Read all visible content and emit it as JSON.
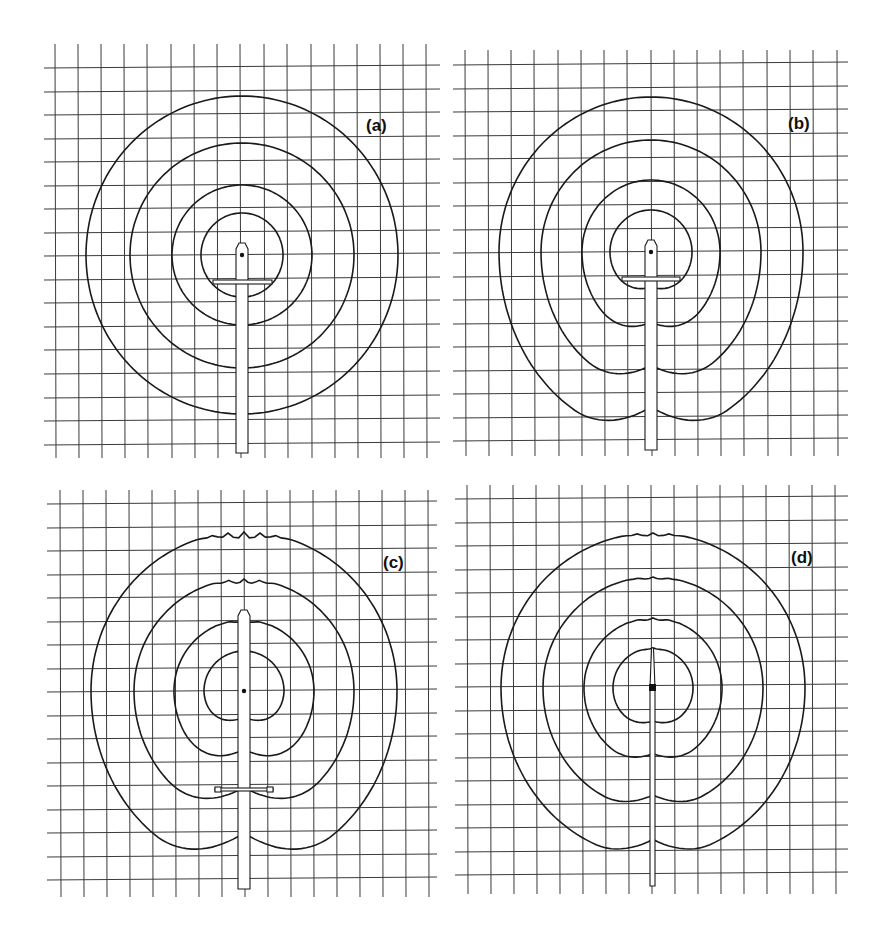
{
  "figure": {
    "title": "",
    "colors": {
      "ink": "#1a1a1a",
      "grid": "#3a3a3a",
      "background": "#ffffff"
    },
    "panels": [
      {
        "id": "a",
        "label": "(a)",
        "label_pos": [
          366,
          131
        ],
        "grid": {
          "x0": 55,
          "x1": 427,
          "y0": 44,
          "y1": 458,
          "cols_x": [
            55,
            78,
            101,
            124,
            147,
            171,
            194,
            217,
            240,
            264,
            287,
            311,
            334,
            357,
            380,
            403,
            426
          ],
          "rows_y": [
            67,
            91,
            114,
            138,
            161,
            185,
            208,
            232,
            255,
            279,
            302,
            326,
            349,
            373,
            397,
            420,
            444
          ],
          "line_left": 44,
          "line_right": 440
        },
        "center": [
          242,
          255
        ],
        "contours": [
          {
            "rx": 41,
            "ry": 42,
            "dy": 0,
            "lobe": 0
          },
          {
            "rx": 70,
            "ry": 70,
            "dy": 0,
            "lobe": 0
          },
          {
            "rx": 112,
            "ry": 112,
            "dy": 1,
            "lobe": 0
          },
          {
            "rx": 156,
            "ry": 159,
            "dy": 0,
            "lobe": 0
          }
        ],
        "rod": {
          "x": 236,
          "w": 12,
          "top": 243,
          "bottom": 453,
          "needle": false
        },
        "crossbar": {
          "x1": 213,
          "x2": 272,
          "y": 280,
          "h": 4,
          "end_squares": false
        }
      },
      {
        "id": "b",
        "label": "(b)",
        "label_pos": [
          788,
          129
        ],
        "grid": {
          "x0": 464,
          "x1": 846,
          "y0": 50,
          "y1": 456,
          "cols_x": [
            465,
            488,
            511,
            534,
            558,
            581,
            604,
            627,
            651,
            674,
            697,
            720,
            743,
            767,
            790,
            813,
            837
          ],
          "rows_y": [
            64,
            88,
            111,
            135,
            158,
            182,
            205,
            229,
            252,
            276,
            299,
            323,
            346,
            370,
            393,
            417,
            440
          ],
          "line_left": 453,
          "line_right": 848
        },
        "center": [
          651,
          252
        ],
        "contours": [
          {
            "rx": 41,
            "ry": 42,
            "dy": 0,
            "lobe": 1
          },
          {
            "rx": 69,
            "ry": 72,
            "dy": 12,
            "lobe": 2
          },
          {
            "rx": 110,
            "ry": 112,
            "dy": 22,
            "lobe": 3
          },
          {
            "rx": 152,
            "ry": 155,
            "dy": 28,
            "lobe": 4
          }
        ],
        "rod": {
          "x": 645,
          "w": 12,
          "top": 240,
          "bottom": 450,
          "needle": false
        },
        "crossbar": {
          "x1": 622,
          "x2": 680,
          "y": 277,
          "h": 4,
          "end_squares": false
        }
      },
      {
        "id": "c",
        "label": "(c)",
        "label_pos": [
          383,
          568
        ],
        "grid": {
          "x0": 60,
          "x1": 430,
          "y0": 490,
          "y1": 897,
          "cols_x": [
            60,
            83,
            106,
            129,
            152,
            175,
            198,
            221,
            244,
            267,
            290,
            313,
            336,
            359,
            382,
            405,
            428
          ],
          "rows_y": [
            503,
            527,
            550,
            574,
            597,
            621,
            644,
            668,
            691,
            715,
            738,
            762,
            785,
            809,
            832,
            856,
            879
          ],
          "line_left": 47,
          "line_right": 437
        },
        "center": [
          244,
          691
        ],
        "contours": [
          {
            "rx": 40,
            "ry": 40,
            "dy": 0,
            "lobe": 2,
            "top_notch": 0
          },
          {
            "rx": 70,
            "ry": 71,
            "dy": 8,
            "lobe": 3,
            "top_notch": 1
          },
          {
            "rx": 110,
            "ry": 112,
            "dy": 12,
            "lobe": 4,
            "top_notch": 2
          },
          {
            "rx": 153,
            "ry": 159,
            "dy": 18,
            "lobe": 5,
            "top_notch": 3
          }
        ],
        "rod": {
          "x": 238,
          "w": 12,
          "top": 610,
          "bottom": 889,
          "needle": false
        },
        "crossbar": {
          "x1": 215,
          "x2": 273,
          "y": 788,
          "h": 3,
          "end_squares": true
        }
      },
      {
        "id": "d",
        "label": "(d)",
        "label_pos": [
          791,
          563
        ],
        "grid": {
          "x0": 467,
          "x1": 836,
          "y0": 485,
          "y1": 894,
          "cols_x": [
            467,
            490,
            513,
            536,
            559,
            582,
            605,
            628,
            651,
            674,
            697,
            720,
            743,
            766,
            789,
            812,
            835
          ],
          "rows_y": [
            498,
            522,
            545,
            569,
            592,
            616,
            639,
            663,
            686,
            710,
            733,
            757,
            780,
            804,
            827,
            851,
            874
          ],
          "line_left": 455,
          "line_right": 848
        },
        "center": [
          653,
          688
        ],
        "contours": [
          {
            "rx": 40,
            "ry": 40,
            "dy": 0,
            "lobe": 1,
            "top_notch": 0.5
          },
          {
            "rx": 69,
            "ry": 70,
            "dy": 6,
            "lobe": 1.5,
            "top_notch": 1
          },
          {
            "rx": 110,
            "ry": 111,
            "dy": 10,
            "lobe": 2,
            "top_notch": 1
          },
          {
            "rx": 152,
            "ry": 155,
            "dy": 14,
            "lobe": 2.5,
            "top_notch": 1.5
          }
        ],
        "rod": {
          "x": 650,
          "w": 5,
          "top": 648,
          "bottom": 886,
          "needle": true
        },
        "crossbar": null
      }
    ]
  }
}
